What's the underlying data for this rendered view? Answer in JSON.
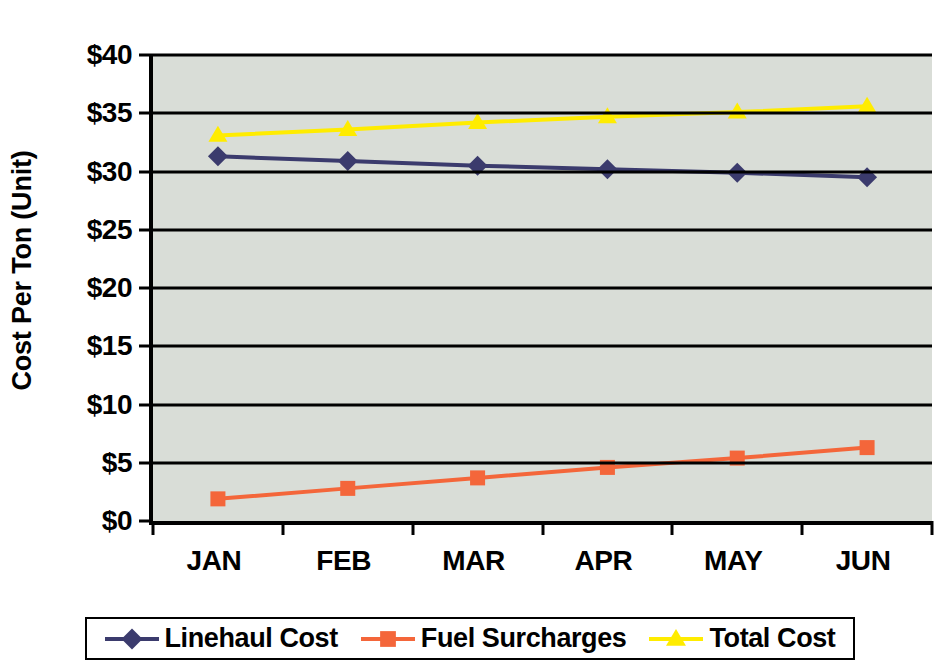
{
  "chart_data": {
    "type": "line",
    "title": "",
    "xlabel": "",
    "ylabel": "Cost Per Ton (Unit)",
    "categories": [
      "JAN",
      "FEB",
      "MAR",
      "APR",
      "MAY",
      "JUN"
    ],
    "ylim": [
      0,
      40
    ],
    "ytick_step": 5,
    "ytick_labels": [
      "$40",
      "$35",
      "$30",
      "$25",
      "$20",
      "$15",
      "$10",
      "$5",
      "$0"
    ],
    "ytick_values": [
      40,
      35,
      30,
      25,
      20,
      15,
      10,
      5,
      0
    ],
    "grid": true,
    "legend_position": "bottom",
    "plot_background": "#d9ddd7",
    "series": [
      {
        "name": "Linehaul Cost",
        "color": "#3b3b6d",
        "marker": "diamond",
        "values": [
          31.3,
          30.9,
          30.5,
          30.2,
          29.9,
          29.5
        ]
      },
      {
        "name": "Fuel Surcharges",
        "color": "#f4663a",
        "marker": "square",
        "values": [
          1.9,
          2.8,
          3.7,
          4.6,
          5.4,
          6.3
        ]
      },
      {
        "name": "Total Cost",
        "color": "#ffec00",
        "marker": "triangle",
        "values": [
          33.1,
          33.6,
          34.2,
          34.7,
          35.1,
          35.6
        ]
      }
    ]
  },
  "legend": {
    "entries": [
      {
        "label": "Linehaul Cost",
        "color": "#3b3b6d",
        "marker": "diamond"
      },
      {
        "label": "Fuel Surcharges",
        "color": "#f4663a",
        "marker": "square"
      },
      {
        "label": "Total Cost",
        "color": "#ffec00",
        "marker": "triangle"
      }
    ]
  }
}
